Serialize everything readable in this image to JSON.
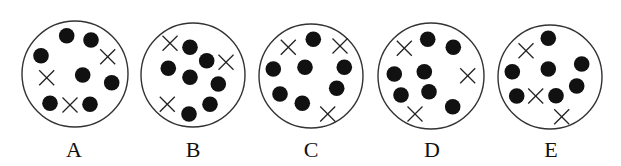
{
  "figure": {
    "width": 621,
    "height": 166,
    "colors": {
      "background": "#ffffff",
      "ring": "#333333",
      "dot": "#111111",
      "cross": "#222222",
      "label": "#111111"
    },
    "dot_radius": 7.8,
    "cross_half": 7.5,
    "panels": [
      {
        "label": "A",
        "label_pos": [
          74,
          157
        ],
        "circle": {
          "cx": 75,
          "cy": 74,
          "r": 53
        },
        "dots": [
          [
            66.7,
            35.7
          ],
          [
            91,
            40
          ],
          [
            41,
            55.7
          ],
          [
            82.7,
            75
          ],
          [
            111.7,
            82.7
          ],
          [
            50,
            103.3
          ],
          [
            90,
            104.3
          ]
        ],
        "crosses": [
          [
            107.7,
            56.7
          ],
          [
            46.7,
            77.7
          ],
          [
            70,
            105
          ]
        ]
      },
      {
        "label": "B",
        "label_pos": [
          193,
          157
        ],
        "circle": {
          "cx": 193,
          "cy": 75,
          "r": 52
        },
        "dots": [
          [
            190,
            47.3
          ],
          [
            206.7,
            60.7
          ],
          [
            168.3,
            68.3
          ],
          [
            190,
            77.3
          ],
          [
            218.3,
            84
          ],
          [
            210,
            104.3
          ],
          [
            189,
            114
          ]
        ],
        "crosses": [
          [
            170,
            43.3
          ],
          [
            226,
            62.3
          ],
          [
            167.3,
            104.3
          ]
        ]
      },
      {
        "label": "C",
        "label_pos": [
          311,
          157
        ],
        "circle": {
          "cx": 311,
          "cy": 76,
          "r": 52
        },
        "dots": [
          [
            313.3,
            39.3
          ],
          [
            273.3,
            69
          ],
          [
            305,
            67.3
          ],
          [
            344.3,
            67.3
          ],
          [
            280,
            94
          ],
          [
            336.7,
            88.3
          ],
          [
            302.3,
            103.3
          ]
        ],
        "crosses": [
          [
            288.3,
            47.3
          ],
          [
            340,
            46
          ],
          [
            327.7,
            114
          ]
        ]
      },
      {
        "label": "D",
        "label_pos": [
          432,
          157
        ],
        "circle": {
          "cx": 431,
          "cy": 76,
          "r": 53
        },
        "dots": [
          [
            427.7,
            39.3
          ],
          [
            453.3,
            47.3
          ],
          [
            394.3,
            74
          ],
          [
            424.3,
            71.7
          ],
          [
            401,
            95
          ],
          [
            429,
            91.7
          ],
          [
            452.7,
            106.7
          ]
        ],
        "crosses": [
          [
            404.3,
            48.3
          ],
          [
            467.7,
            75.7
          ],
          [
            415,
            114
          ]
        ]
      },
      {
        "label": "E",
        "label_pos": [
          551,
          157
        ],
        "circle": {
          "cx": 550,
          "cy": 77,
          "r": 52
        },
        "dots": [
          [
            548.3,
            38.3
          ],
          [
            512.3,
            71.7
          ],
          [
            548.3,
            69
          ],
          [
            581.7,
            64
          ],
          [
            576.7,
            86
          ],
          [
            516.7,
            96
          ],
          [
            556,
            95.7
          ]
        ],
        "crosses": [
          [
            526,
            50.7
          ],
          [
            535.7,
            96
          ],
          [
            561.7,
            116.7
          ]
        ]
      }
    ]
  }
}
